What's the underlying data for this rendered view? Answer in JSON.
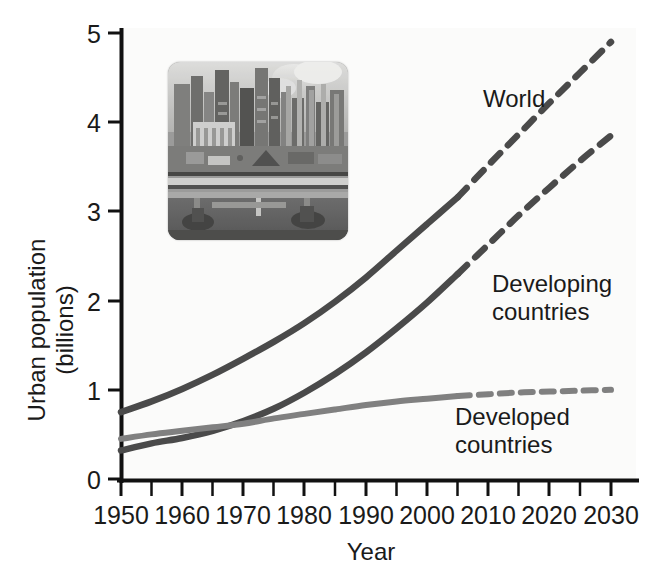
{
  "chart_data": {
    "type": "line",
    "title": "",
    "xlabel": "Year",
    "ylabel": "Urban population (billions)",
    "ylabel_line1": "Urban population",
    "ylabel_line2": "(billions)",
    "xlim": [
      1950,
      2030
    ],
    "ylim": [
      0,
      5
    ],
    "grid": false,
    "legend_position": "inline-annotations",
    "x_ticks_major": [
      1950,
      1960,
      1970,
      1980,
      1990,
      2000,
      2010,
      2020,
      2030
    ],
    "x_ticks_minor": [
      1955,
      1965,
      1975,
      1985,
      1995,
      2005,
      2015,
      2025
    ],
    "x_tick_labels": [
      "1950",
      "1960",
      "1970",
      "1980",
      "1990",
      "2000",
      "2010",
      "2020",
      "2030"
    ],
    "y_ticks": [
      0,
      1,
      2,
      3,
      4,
      5
    ],
    "y_tick_labels": [
      "0",
      "1",
      "2",
      "3",
      "4",
      "5"
    ],
    "projection_start_year": 2005,
    "x": [
      1950,
      1955,
      1960,
      1965,
      1970,
      1975,
      1980,
      1985,
      1990,
      1995,
      2000,
      2005,
      2010,
      2015,
      2020,
      2025,
      2030
    ],
    "series": [
      {
        "name": "World",
        "label": "World",
        "color": "#4a4a4a",
        "style_historical": "solid",
        "style_projection": "dashed",
        "values": [
          0.75,
          0.87,
          1.01,
          1.17,
          1.35,
          1.54,
          1.75,
          1.99,
          2.26,
          2.56,
          2.86,
          3.16,
          3.52,
          3.87,
          4.22,
          4.56,
          4.9
        ]
      },
      {
        "name": "Developing countries",
        "label": "Developing countries",
        "label_line1": "Developing",
        "label_line2": "countries",
        "color": "#4a4a4a",
        "style_historical": "solid",
        "style_projection": "dashed",
        "values": [
          0.32,
          0.4,
          0.46,
          0.54,
          0.65,
          0.79,
          0.97,
          1.18,
          1.42,
          1.69,
          1.98,
          2.3,
          2.63,
          2.96,
          3.27,
          3.57,
          3.85
        ]
      },
      {
        "name": "Developed countries",
        "label": "Developed countries",
        "label_line1": "Developed",
        "label_line2": "countries",
        "color": "#808080",
        "style_historical": "solid",
        "style_projection": "dashed",
        "values": [
          0.45,
          0.5,
          0.54,
          0.58,
          0.62,
          0.68,
          0.73,
          0.78,
          0.83,
          0.87,
          0.9,
          0.93,
          0.95,
          0.97,
          0.98,
          0.99,
          1.0
        ]
      }
    ],
    "annotations": [
      {
        "text": "World",
        "x": 2008,
        "y": 4.2
      },
      {
        "text": "Developing countries",
        "x": 2010,
        "y": 2.55
      },
      {
        "text": "Developed countries",
        "x": 2012,
        "y": 0.72
      }
    ],
    "inset_image": {
      "name": "urban-cityscape-photo",
      "description": "Grayscale aerial photograph of a dense city waterfront with high-rise buildings, industrial smokestacks and a bridge",
      "x_range": [
        1957,
        1977
      ],
      "y_range": [
        3.0,
        5.2
      ]
    }
  },
  "axis": {
    "y_label_line1": "Urban population",
    "y_label_line2": "(billions)",
    "x_label": "Year"
  },
  "labels": {
    "world": "World",
    "developing_line1": "Developing",
    "developing_line2": "countries",
    "developed_line1": "Developed",
    "developed_line2": "countries"
  },
  "ticks": {
    "y": [
      "5",
      "4",
      "3",
      "2",
      "1",
      "0"
    ],
    "x": [
      "1950",
      "1960",
      "1970",
      "1980",
      "1990",
      "2000",
      "2010",
      "2020",
      "2030"
    ]
  },
  "colors": {
    "dark_line": "#4a4a4a",
    "light_line": "#808080",
    "axis": "#111111",
    "text": "#1a1a1a",
    "background": "#ffffff",
    "plot_background": "#fbfbfa"
  }
}
